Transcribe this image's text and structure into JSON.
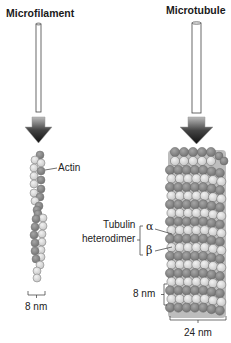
{
  "titles": {
    "left": "Microfilament",
    "right": "Microtubule"
  },
  "labels": {
    "actin": "Actin",
    "tubulin_line1": "Tubulin",
    "tubulin_line2": "heterodimer",
    "alpha": "α",
    "beta": "β",
    "microfilament_width": "8 nm",
    "microtubule_period": "8 nm",
    "microtubule_width": "24 nm"
  },
  "colors": {
    "dark_subunit": "#8a8a8a",
    "light_subunit": "#dcdcdc",
    "outline": "#555555",
    "arrow_dark": "#222222"
  }
}
